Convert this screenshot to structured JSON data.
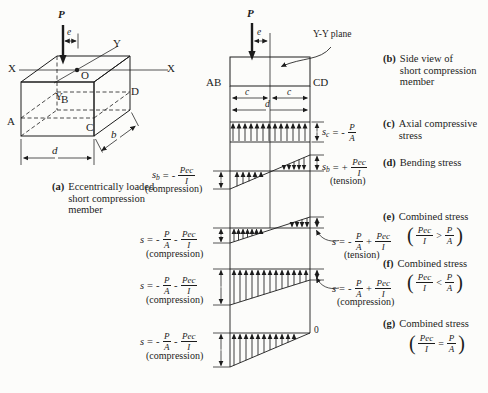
{
  "box": {
    "P": "P",
    "e": "e",
    "X_left": "X",
    "X_right": "X",
    "Y_upper": "Y",
    "Y_lower": "Y",
    "O": "O",
    "A": "A",
    "B": "B",
    "C": "C",
    "D": "D",
    "d": "d",
    "b": "b",
    "caption_tag": "(a)",
    "caption_lines": [
      "Eccentrically loaded",
      "short compression",
      "member"
    ]
  },
  "column": {
    "P": "P",
    "e": "e",
    "yy_plane": "Y-Y plane",
    "AB": "AB",
    "CD": "CD",
    "c_left": "c",
    "c_right": "c",
    "d": "d",
    "zero": "0"
  },
  "formulas": {
    "sc": {
      "lhs": "s",
      "sub": "c",
      "eq": "=",
      "sign": "-",
      "num": "P",
      "den": "A"
    },
    "sb_left": {
      "lhs": "s",
      "sub": "b",
      "eq": "=",
      "sign": "-",
      "num": "Pec",
      "den": "I",
      "note": "(compression)"
    },
    "sb_right": {
      "lhs": "s",
      "sub": "b",
      "eq": "=",
      "sign": "+",
      "num": "Pec",
      "den": "I",
      "note": "(tension)"
    },
    "e_left": {
      "lhs": "s",
      "eq": "=",
      "sign1": "-",
      "num1": "P",
      "den1": "A",
      "sign2": "-",
      "num2": "Pec",
      "den2": "I",
      "note": "(compression)"
    },
    "e_right": {
      "lhs": "s",
      "eq": "=",
      "sign1": "-",
      "num1": "P",
      "den1": "A",
      "sign2": "+",
      "num2": "Pec",
      "den2": "I",
      "note": "(tension)"
    },
    "f_left": {
      "lhs": "s",
      "eq": "=",
      "sign1": "-",
      "num1": "P",
      "den1": "A",
      "sign2": "-",
      "num2": "Pec",
      "den2": "I",
      "note": "(compression)"
    },
    "f_right": {
      "lhs": "s",
      "eq": "=",
      "sign1": "-",
      "num1": "P",
      "den1": "A",
      "sign2": "+",
      "num2": "Pec",
      "den2": "I",
      "note": "(compression)"
    },
    "g_left": {
      "lhs": "s",
      "eq": "=",
      "sign1": "-",
      "num1": "P",
      "den1": "A",
      "sign2": "-",
      "num2": "Pec",
      "den2": "I",
      "note": "(compression)"
    }
  },
  "side_labels": {
    "b": {
      "tag": "(b)",
      "lines": [
        "Side view of",
        "short compression",
        "member"
      ]
    },
    "c": {
      "tag": "(c)",
      "lines": [
        "Axial compressive",
        "stress"
      ]
    },
    "d": {
      "tag": "(d)",
      "lines": [
        "Bending stress"
      ]
    },
    "e": {
      "tag": "(e)",
      "lines": [
        "Combined stress"
      ],
      "cond": {
        "open": "(",
        "num1": "Pec",
        "den1": "I",
        "rel": ">",
        "num2": "P",
        "den2": "A",
        "close": ")"
      }
    },
    "f": {
      "tag": "(f)",
      "lines": [
        "Combined stress"
      ],
      "cond": {
        "open": "(",
        "num1": "Pec",
        "den1": "I",
        "rel": "<",
        "num2": "P",
        "den2": "A",
        "close": ")"
      }
    },
    "g": {
      "tag": "(g)",
      "lines": [
        "Combined stress"
      ],
      "cond": {
        "open": "(",
        "num1": "Pec",
        "den1": "I",
        "rel": "=",
        "num2": "P",
        "den2": "A",
        "close": ")"
      }
    }
  }
}
